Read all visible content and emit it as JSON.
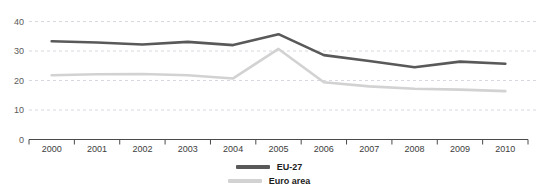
{
  "chart_data": {
    "type": "line",
    "title": "",
    "subtitle": "",
    "xlabel": "",
    "ylabel": "",
    "categories": [
      "2000",
      "2001",
      "2002",
      "2003",
      "2004",
      "2005",
      "2006",
      "2007",
      "2008",
      "2009",
      "2010"
    ],
    "series": [
      {
        "name": "EU-27",
        "color": "#595959",
        "values": [
          33.3,
          32.9,
          32.2,
          33.1,
          32.0,
          35.7,
          28.6,
          26.6,
          24.5,
          26.4,
          25.7
        ]
      },
      {
        "name": "Euro area",
        "color": "#d2d2d2",
        "values": [
          21.8,
          22.1,
          22.2,
          21.8,
          20.7,
          30.7,
          19.4,
          18.0,
          17.2,
          16.9,
          16.4
        ]
      }
    ],
    "ylim": [
      0,
      40
    ],
    "yticks": [
      0,
      10,
      20,
      30,
      40
    ],
    "ytick_labels": [
      "0",
      "10",
      "20",
      "30",
      "40"
    ],
    "grid": true,
    "grid_style": "dashed",
    "grid_color": "#d8d8e0",
    "legend_position": "bottom-center",
    "axis_color": "#4a4a4a"
  },
  "legend": {
    "entries": [
      {
        "label": "EU-27"
      },
      {
        "label": "Euro area"
      }
    ]
  },
  "axes": {
    "y_labels": [
      "40",
      "30",
      "20",
      "10",
      "0"
    ],
    "x_labels": [
      "2000",
      "2001",
      "2002",
      "2003",
      "2004",
      "2005",
      "2006",
      "2007",
      "2008",
      "2009",
      "2010"
    ]
  }
}
